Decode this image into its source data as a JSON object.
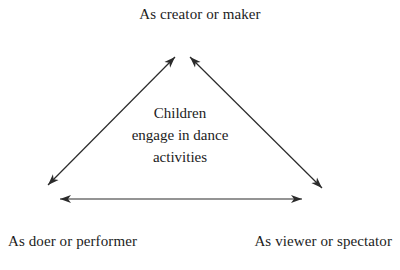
{
  "diagram": {
    "vertices": {
      "top": "As creator or maker",
      "bottom_left": "As doer or performer",
      "bottom_right": "As viewer or spectator"
    },
    "center": [
      "Children",
      "engage in dance",
      "activities"
    ],
    "edges": [
      {
        "from": "bottom_left",
        "to": "top",
        "bidirectional": true
      },
      {
        "from": "bottom_right",
        "to": "top",
        "bidirectional": true
      },
      {
        "from": "bottom_left",
        "to": "bottom_right",
        "bidirectional": true
      }
    ],
    "colors": {
      "background": "#ffffff",
      "text": "#1c1c1c",
      "arrow": "#2b2b2b"
    }
  }
}
